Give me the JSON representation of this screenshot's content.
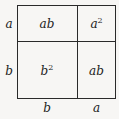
{
  "diagram": {
    "type": "area-model-square",
    "side_labels": {
      "left_top": "a",
      "left_bottom": "b",
      "bottom_left": "b",
      "bottom_right": "a"
    },
    "regions": {
      "top_left": {
        "base": "ab",
        "sup": ""
      },
      "top_right": {
        "base": "a",
        "sup": "2"
      },
      "bottom_left": {
        "base": "b",
        "sup": "2"
      },
      "bottom_right": {
        "base": "ab",
        "sup": ""
      }
    },
    "colors": {
      "line": "#2a2a2a",
      "background": "#f7f6f4",
      "text": "#222222"
    }
  }
}
